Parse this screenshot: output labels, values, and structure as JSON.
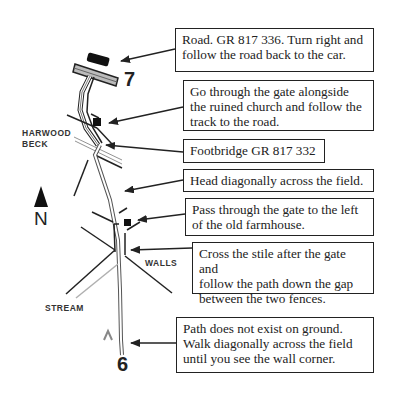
{
  "map": {
    "north_label": "N",
    "waypoints": [
      {
        "label": "7",
        "position": "top"
      },
      {
        "label": "6",
        "position": "bottom"
      }
    ],
    "area_labels": {
      "beck_line1": "HARWOOD",
      "beck_line2": "BECK",
      "walls": "WALLS",
      "stream": "STREAM"
    },
    "colors": {
      "ink": "#222222",
      "path_fill": "#ffffff",
      "stream": "#b0b0b0",
      "background": "#ffffff"
    }
  },
  "callouts": [
    {
      "text": "Road. GR 817 336. Turn right and\nfollow the road back to the car."
    },
    {
      "text": "Go through the gate alongside\nthe ruined church and follow the\ntrack to the road."
    },
    {
      "text": "Footbridge GR 817 332"
    },
    {
      "text": "Head diagonally across the field."
    },
    {
      "text": "Pass through the gate to the left\nof the old farmhouse."
    },
    {
      "text": "Cross the stile after the gate and\nfollow the path down the gap\nbetween the two fences."
    },
    {
      "text": "Path does not exist on ground.\nWalk diagonally across the field\nuntil you see the wall corner."
    }
  ]
}
